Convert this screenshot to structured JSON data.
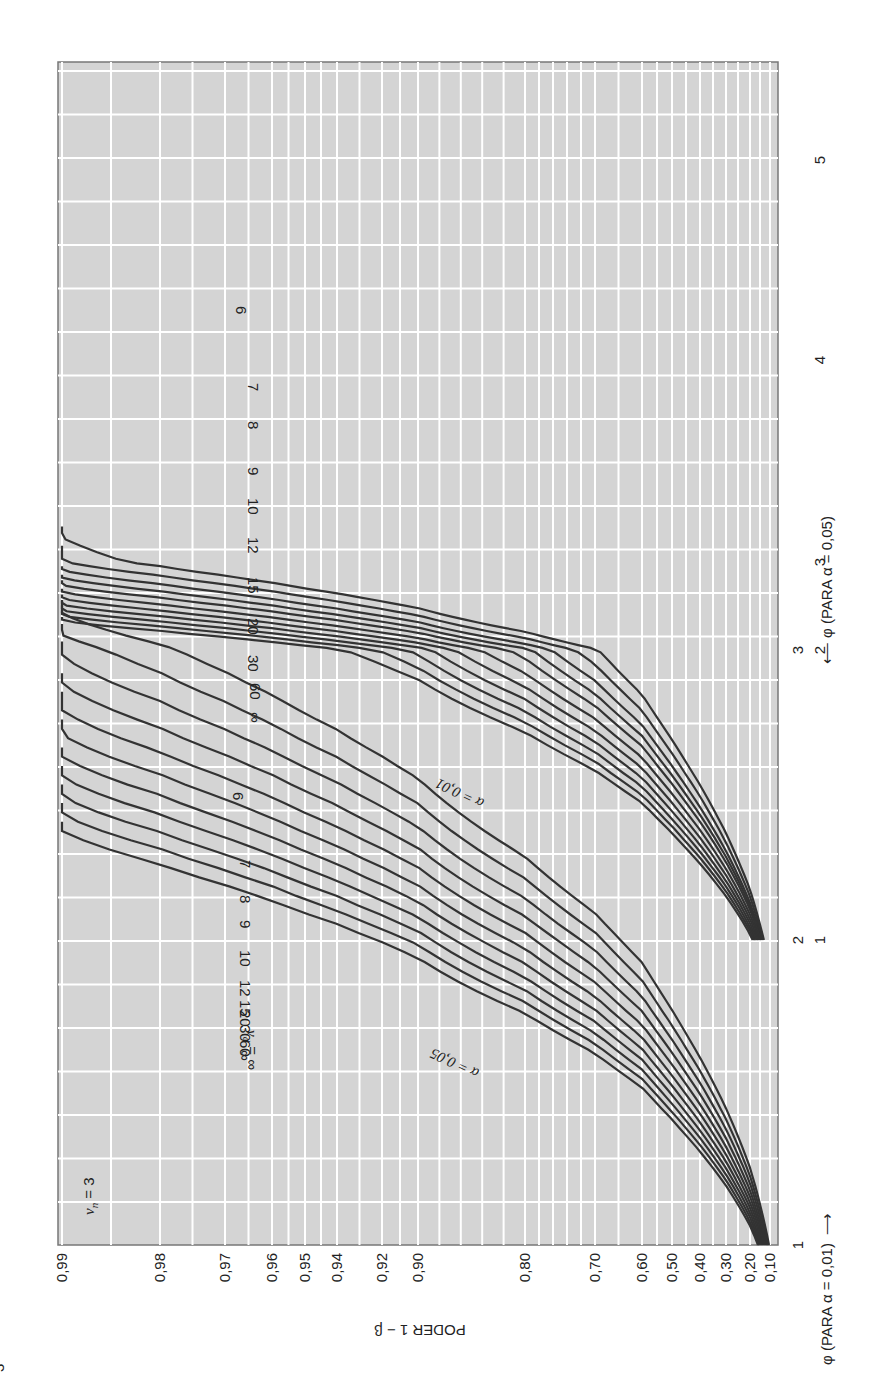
{
  "chart_data": {
    "type": "line",
    "title": "",
    "orientation_note": "Chart printed rotated 90° counterclockwise on the page",
    "data_provenance": "Curve values below are a parametric reconstruction, not point-by-point readings from the chart. Only each curve's approximate start point (low-power end) and its 0,99 crossing were visually anchored; intermediate points come from a smooth monotone function fitted to those anchors. Treat intermediate values as approximate and do not use them as exact Pearson-Hartley power-chart values.",
    "panel_label": "ν_n = 3",
    "ylabel": "PODER 1 − β",
    "xlabel_alpha_001": "φ (PARA α = 0,01)",
    "xlabel_alpha_005": "φ (PARA α = 0,05)",
    "y_ticks": [
      "0,99",
      "0,98",
      "0,97",
      "0,96",
      "0,95",
      "0,94",
      "0,92",
      "0,90",
      "0,80",
      "0,70",
      "0,60",
      "0,50",
      "0,40",
      "0,30",
      "0,20",
      "0,10"
    ],
    "y_tick_values": [
      0.99,
      0.98,
      0.97,
      0.96,
      0.95,
      0.94,
      0.92,
      0.9,
      0.8,
      0.7,
      0.6,
      0.5,
      0.4,
      0.3,
      0.2,
      0.1
    ],
    "x_ticks_alpha_001": [
      "1",
      "2",
      "3"
    ],
    "x_ticks_alpha_005": [
      "1",
      "2",
      "3",
      "4",
      "5"
    ],
    "ylim": [
      0.1,
      0.99
    ],
    "grid": true,
    "legend": "inline curve labels (ν_d)",
    "annotations": [
      "α = 0,05",
      "α = 0,01",
      "ν_d = ∞"
    ],
    "series_alpha_005": [
      {
        "name": "ν_d=6",
        "alpha": 0.05,
        "nu_d": "6",
        "x": [
          1.0,
          1.5,
          2.0,
          2.5,
          3.0,
          3.5
        ],
        "y": [
          0.16,
          0.32,
          0.53,
          0.74,
          0.89,
          0.96
        ]
      },
      {
        "name": "ν_d=7",
        "alpha": 0.05,
        "nu_d": "7",
        "x": [
          1.0,
          1.5,
          2.0,
          2.5,
          3.0,
          3.4
        ],
        "y": [
          0.17,
          0.35,
          0.58,
          0.79,
          0.92,
          0.97
        ]
      },
      {
        "name": "ν_d=8",
        "alpha": 0.05,
        "nu_d": "8",
        "x": [
          1.0,
          1.5,
          2.0,
          2.5,
          3.0,
          3.3
        ],
        "y": [
          0.18,
          0.37,
          0.61,
          0.82,
          0.94,
          0.975
        ]
      },
      {
        "name": "ν_d=9",
        "alpha": 0.05,
        "nu_d": "9",
        "x": [
          1.0,
          1.5,
          2.0,
          2.5,
          3.0,
          3.25
        ],
        "y": [
          0.185,
          0.39,
          0.63,
          0.84,
          0.95,
          0.98
        ]
      },
      {
        "name": "ν_d=10",
        "alpha": 0.05,
        "nu_d": "10",
        "x": [
          1.0,
          1.5,
          2.0,
          2.5,
          3.0,
          3.2
        ],
        "y": [
          0.19,
          0.4,
          0.65,
          0.85,
          0.955,
          0.98
        ]
      },
      {
        "name": "ν_d=12",
        "alpha": 0.05,
        "nu_d": "12",
        "x": [
          1.0,
          1.5,
          2.0,
          2.5,
          3.0,
          3.1
        ],
        "y": [
          0.2,
          0.42,
          0.68,
          0.87,
          0.965,
          0.98
        ]
      },
      {
        "name": "ν_d=15",
        "alpha": 0.05,
        "nu_d": "15",
        "x": [
          1.0,
          1.5,
          2.0,
          2.5,
          2.9,
          3.05
        ],
        "y": [
          0.21,
          0.44,
          0.7,
          0.89,
          0.965,
          0.98
        ]
      },
      {
        "name": "ν_d=20",
        "alpha": 0.05,
        "nu_d": "20",
        "x": [
          1.0,
          1.5,
          2.0,
          2.5,
          2.9,
          3.0
        ],
        "y": [
          0.22,
          0.46,
          0.73,
          0.91,
          0.975,
          0.985
        ]
      },
      {
        "name": "ν_d=30",
        "alpha": 0.05,
        "nu_d": "30",
        "x": [
          1.0,
          1.5,
          2.0,
          2.5,
          2.85,
          2.95
        ],
        "y": [
          0.23,
          0.48,
          0.75,
          0.92,
          0.975,
          0.985
        ]
      },
      {
        "name": "ν_d=60",
        "alpha": 0.05,
        "nu_d": "60",
        "x": [
          1.0,
          1.5,
          2.0,
          2.5,
          2.8,
          2.9
        ],
        "y": [
          0.24,
          0.5,
          0.77,
          0.93,
          0.98,
          0.99
        ]
      },
      {
        "name": "ν_d=∞",
        "alpha": 0.05,
        "nu_d": "∞",
        "x": [
          1.0,
          1.5,
          2.0,
          2.5,
          2.75,
          2.85
        ],
        "y": [
          0.25,
          0.52,
          0.79,
          0.94,
          0.98,
          0.99
        ]
      }
    ],
    "series_alpha_001": [
      {
        "name": "ν_d=6",
        "alpha": 0.01,
        "nu_d": "6",
        "x": [
          2.0,
          2.5,
          3.0,
          3.5,
          4.0,
          4.5
        ],
        "y": [
          0.11,
          0.25,
          0.47,
          0.71,
          0.88,
          0.97
        ]
      },
      {
        "name": "ν_d=7",
        "alpha": 0.01,
        "nu_d": "7",
        "x": [
          2.0,
          2.5,
          3.0,
          3.5,
          4.0,
          4.3
        ],
        "y": [
          0.12,
          0.28,
          0.53,
          0.77,
          0.92,
          0.97
        ]
      },
      {
        "name": "ν_d=8",
        "alpha": 0.01,
        "nu_d": "8",
        "x": [
          2.0,
          2.5,
          3.0,
          3.5,
          4.0,
          4.2
        ],
        "y": [
          0.13,
          0.31,
          0.57,
          0.81,
          0.94,
          0.975
        ]
      },
      {
        "name": "ν_d=9",
        "alpha": 0.01,
        "nu_d": "9",
        "x": [
          2.0,
          2.5,
          3.0,
          3.5,
          3.9,
          4.1
        ],
        "y": [
          0.14,
          0.33,
          0.6,
          0.83,
          0.94,
          0.975
        ]
      },
      {
        "name": "ν_d=10",
        "alpha": 0.01,
        "nu_d": "10",
        "x": [
          2.0,
          2.5,
          3.0,
          3.5,
          3.9,
          4.05
        ],
        "y": [
          0.15,
          0.35,
          0.62,
          0.85,
          0.95,
          0.98
        ]
      },
      {
        "name": "ν_d=12",
        "alpha": 0.01,
        "nu_d": "12",
        "x": [
          2.0,
          2.5,
          3.0,
          3.5,
          3.8,
          3.95
        ],
        "y": [
          0.16,
          0.38,
          0.66,
          0.88,
          0.95,
          0.98
        ]
      },
      {
        "name": "ν_d=15",
        "alpha": 0.01,
        "nu_d": "15",
        "x": [
          2.0,
          2.5,
          3.0,
          3.5,
          3.7,
          3.85
        ],
        "y": [
          0.17,
          0.41,
          0.7,
          0.9,
          0.955,
          0.98
        ]
      },
      {
        "name": "ν_d=20",
        "alpha": 0.01,
        "nu_d": "20",
        "x": [
          2.0,
          2.5,
          3.0,
          3.4,
          3.6,
          3.75
        ],
        "y": [
          0.18,
          0.44,
          0.74,
          0.9,
          0.955,
          0.98
        ]
      },
      {
        "name": "ν_d=30",
        "alpha": 0.01,
        "nu_d": "30",
        "x": [
          2.0,
          2.5,
          3.0,
          3.3,
          3.5,
          3.65
        ],
        "y": [
          0.19,
          0.47,
          0.77,
          0.91,
          0.96,
          0.98
        ]
      },
      {
        "name": "ν_d=60",
        "alpha": 0.01,
        "nu_d": "60",
        "x": [
          2.0,
          2.5,
          3.0,
          3.25,
          3.45,
          3.6
        ],
        "y": [
          0.2,
          0.5,
          0.8,
          0.92,
          0.97,
          0.985
        ]
      },
      {
        "name": "ν_d=∞",
        "alpha": 0.01,
        "nu_d": "∞",
        "x": [
          2.0,
          2.5,
          3.0,
          3.2,
          3.4,
          3.55
        ],
        "y": [
          0.21,
          0.53,
          0.83,
          0.93,
          0.975,
          0.99
        ]
      }
    ]
  },
  "labels": {
    "panel_nu_n": "ν",
    "panel_nu_n_sub": "n",
    "panel_nu_n_rest": " = 3",
    "y_axis_title": "PODER 1 − β",
    "nu_d_prefix": "ν",
    "nu_d_sub": "d",
    "nu_d_eq": " = ∞",
    "alpha005": "α = 0,05",
    "alpha001": "α = 0,01",
    "phi_axis_001": "φ (PARA α = 0,01)",
    "phi_axis_005": "φ (PARA α = 0,05)",
    "arrow_right": "⟶",
    "arrow_left": "⟵",
    "page_mark": "3"
  },
  "colors": {
    "background": "#d4d4d4",
    "grid": "#ffffff",
    "curve": "#333333",
    "frame": "#777777",
    "text": "#222222"
  }
}
